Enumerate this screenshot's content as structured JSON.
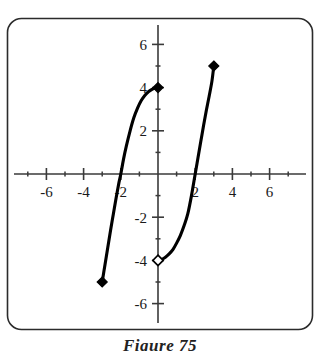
{
  "figure": {
    "caption": "Figure 75",
    "frame_color": "#2b2b2b",
    "background": "#ffffff",
    "curve_color": "#000000"
  },
  "chart_data": {
    "type": "line",
    "title": "",
    "subtitle": "",
    "xlabel": "",
    "ylabel": "",
    "xlim": [
      -7.6,
      7.6
    ],
    "ylim": [
      -6.9,
      6.9
    ],
    "grid": false,
    "legend": "none",
    "axes": {
      "x_major_ticks": [
        -6,
        -4,
        -2,
        2,
        4,
        6
      ],
      "x_major_tick_labels": [
        "-6",
        "-4",
        "-2",
        "2",
        "4",
        "6"
      ],
      "x_minor_ticks": [
        -7,
        -5,
        -3,
        -1,
        1,
        3,
        5,
        7
      ],
      "y_major_ticks": [
        6,
        4,
        2,
        -2,
        -4,
        -6
      ],
      "y_major_tick_labels": [
        "6",
        "4",
        "2",
        "-2",
        "-4",
        "-6"
      ],
      "y_minor_ticks": [
        5,
        3,
        1,
        -1,
        -3,
        -5
      ],
      "origin_label": ""
    },
    "series": [
      {
        "name": "left-branch",
        "points": [
          [
            -3.0,
            -5.0
          ],
          [
            -2.85,
            -4.2
          ],
          [
            -2.7,
            -3.4
          ],
          [
            -2.55,
            -2.6
          ],
          [
            -2.4,
            -1.85
          ],
          [
            -2.25,
            -1.1
          ],
          [
            -2.1,
            -0.4
          ],
          [
            -2.0,
            0.0
          ],
          [
            -1.85,
            0.7
          ],
          [
            -1.7,
            1.3
          ],
          [
            -1.5,
            2.0
          ],
          [
            -1.3,
            2.6
          ],
          [
            -1.1,
            3.05
          ],
          [
            -0.9,
            3.4
          ],
          [
            -0.7,
            3.65
          ],
          [
            -0.5,
            3.82
          ],
          [
            -0.3,
            3.93
          ],
          [
            -0.15,
            3.98
          ],
          [
            0.0,
            4.0
          ]
        ],
        "start_marker": {
          "x": -3.0,
          "y": -5.0,
          "style": "filled-diamond"
        },
        "end_marker": {
          "x": 0.0,
          "y": 4.0,
          "style": "filled-diamond"
        }
      },
      {
        "name": "right-branch",
        "points": [
          [
            0.0,
            -4.0
          ],
          [
            0.2,
            -3.95
          ],
          [
            0.4,
            -3.85
          ],
          [
            0.6,
            -3.7
          ],
          [
            0.8,
            -3.5
          ],
          [
            1.0,
            -3.2
          ],
          [
            1.2,
            -2.85
          ],
          [
            1.4,
            -2.4
          ],
          [
            1.6,
            -1.85
          ],
          [
            1.8,
            -1.0
          ],
          [
            2.0,
            0.0
          ],
          [
            2.15,
            0.75
          ],
          [
            2.3,
            1.5
          ],
          [
            2.45,
            2.25
          ],
          [
            2.6,
            2.95
          ],
          [
            2.75,
            3.6
          ],
          [
            2.9,
            4.3
          ],
          [
            3.0,
            5.0
          ]
        ],
        "start_marker": {
          "x": 0.0,
          "y": -4.0,
          "style": "open-diamond"
        },
        "end_marker": {
          "x": 3.0,
          "y": 5.0,
          "style": "filled-diamond"
        }
      }
    ]
  }
}
